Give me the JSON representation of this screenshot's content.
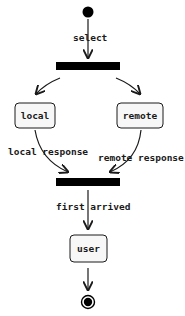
{
  "diagram": {
    "type": "activity",
    "nodes": {
      "start": {
        "kind": "initial"
      },
      "fork": {
        "kind": "fork-bar"
      },
      "local": {
        "kind": "action",
        "label": "local"
      },
      "remote": {
        "kind": "action",
        "label": "remote"
      },
      "join": {
        "kind": "join-bar"
      },
      "user": {
        "kind": "action",
        "label": "user"
      },
      "end": {
        "kind": "final"
      }
    },
    "edges": {
      "select": {
        "from": "start",
        "to": "fork",
        "label": "select"
      },
      "to_local": {
        "from": "fork",
        "to": "local",
        "label": ""
      },
      "to_remote": {
        "from": "fork",
        "to": "remote",
        "label": ""
      },
      "local_response": {
        "from": "local",
        "to": "join",
        "label": "local response"
      },
      "remote_response": {
        "from": "remote",
        "to": "join",
        "label": "remote response"
      },
      "first_arrived": {
        "from": "join",
        "to": "user",
        "label": "first arrived"
      },
      "to_end": {
        "from": "user",
        "to": "end",
        "label": ""
      }
    },
    "colors": {
      "stroke": "#1a1a1a",
      "node_fill": "#f7f7f7",
      "bar_fill": "#000000",
      "background": "#ffffff"
    }
  }
}
